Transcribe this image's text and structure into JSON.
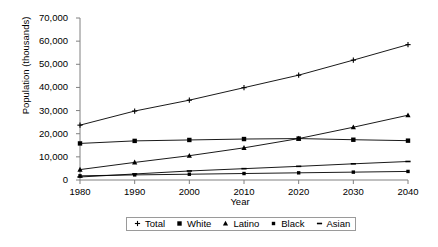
{
  "chart_data": {
    "type": "line",
    "title": "",
    "xlabel": "Year",
    "ylabel": "Population (thousands)",
    "x": [
      1980,
      1990,
      2000,
      2010,
      2020,
      2030,
      2040
    ],
    "xlim": [
      1980,
      2040
    ],
    "ylim": [
      0,
      70000
    ],
    "ytick_values": [
      0,
      10000,
      20000,
      30000,
      40000,
      50000,
      60000,
      70000
    ],
    "ytick_labels": [
      "0",
      "10,000",
      "20,000",
      "30,000",
      "40,000",
      "50,000",
      "60,000",
      "70,000"
    ],
    "xtick_labels": [
      "1980",
      "1990",
      "2000",
      "2010",
      "2020",
      "2030",
      "2040"
    ],
    "grid": false,
    "legend_position": "bottom",
    "series": [
      {
        "name": "Total",
        "marker": "plus",
        "color": "#000000",
        "values": [
          23700,
          29800,
          34500,
          39900,
          45300,
          51800,
          58500
        ]
      },
      {
        "name": "White",
        "marker": "square",
        "color": "#000000",
        "values": [
          15800,
          16900,
          17300,
          17700,
          17900,
          17400,
          17000
        ]
      },
      {
        "name": "Latino",
        "marker": "triangle",
        "color": "#000000",
        "values": [
          4500,
          7600,
          10500,
          13900,
          17900,
          22800,
          28000
        ]
      },
      {
        "name": "Black",
        "marker": "square-small",
        "color": "#000000",
        "values": [
          1800,
          2200,
          2500,
          2800,
          3100,
          3400,
          3700
        ]
      },
      {
        "name": "Asian",
        "marker": "dash",
        "color": "#000000",
        "values": [
          1300,
          2600,
          3900,
          4900,
          5900,
          7000,
          8000
        ]
      }
    ]
  },
  "legend": {
    "items": [
      {
        "label": "Total"
      },
      {
        "label": "White"
      },
      {
        "label": "Latino"
      },
      {
        "label": "Black"
      },
      {
        "label": "Asian"
      }
    ]
  }
}
